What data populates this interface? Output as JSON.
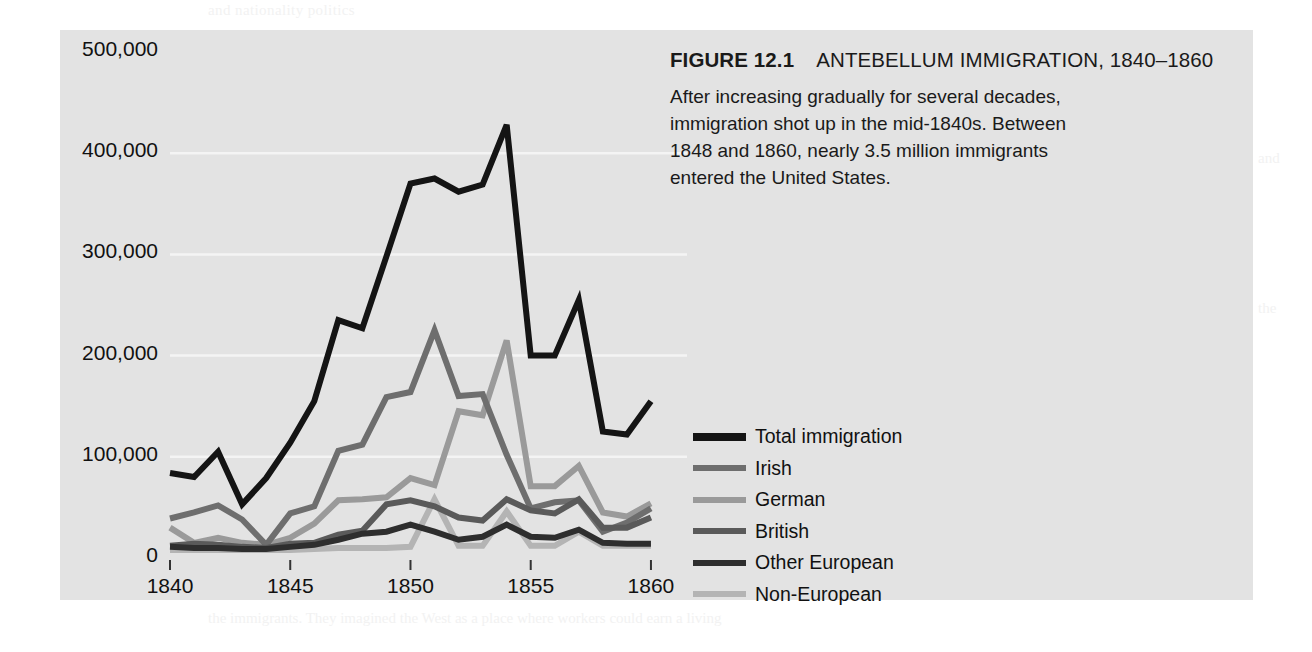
{
  "figure": {
    "number_label": "FIGURE 12.1",
    "title": "ANTEBELLUM IMMIGRATION, 1840–1860",
    "caption": "After increasing gradually for several decades, immigration shot up in the mid-1840s. Between 1848 and 1860, nearly 3.5 million immigrants entered the United States.",
    "panel_background": "#e3e3e3"
  },
  "chart_data": {
    "type": "line",
    "title": "ANTEBELLUM IMMIGRATION, 1840–1860",
    "xlabel": "",
    "ylabel": "",
    "xlim": [
      1840,
      1861
    ],
    "ylim": [
      0,
      500000
    ],
    "grid": true,
    "gridlines": [
      100000,
      200000,
      300000,
      400000
    ],
    "legend_position": "right",
    "x_tick_labels": [
      "1840",
      "1845",
      "1850",
      "1855",
      "1860"
    ],
    "x_ticks": [
      1840,
      1845,
      1850,
      1855,
      1860
    ],
    "y_tick_labels": [
      "0",
      "100,000",
      "200,000",
      "300,000",
      "400,000",
      "500,000"
    ],
    "y_ticks": [
      0,
      100000,
      200000,
      300000,
      400000,
      500000
    ],
    "x": [
      1840,
      1841,
      1842,
      1843,
      1844,
      1845,
      1846,
      1847,
      1848,
      1849,
      1850,
      1851,
      1852,
      1853,
      1854,
      1855,
      1856,
      1857,
      1858,
      1859,
      1860,
      1861
    ],
    "series": [
      {
        "name": "Total immigration",
        "color": "#141414",
        "width": 6,
        "values": [
          84000,
          80000,
          105000,
          53000,
          79000,
          114000,
          155000,
          235000,
          227000,
          298000,
          370000,
          375000,
          362000,
          369000,
          428000,
          200000,
          200000,
          255000,
          125000,
          122000,
          155000,
          0
        ]
      },
      {
        "name": "Irish",
        "color": "#6e6e6e",
        "width": 6,
        "values": [
          39000,
          45000,
          52000,
          38000,
          13000,
          44000,
          51000,
          106000,
          112000,
          159000,
          164000,
          225000,
          160000,
          162000,
          102000,
          49000,
          55000,
          57000,
          26000,
          35000,
          49000,
          0
        ]
      },
      {
        "name": "German",
        "color": "#9a9a9a",
        "width": 6,
        "values": [
          30000,
          15000,
          20000,
          15000,
          13000,
          20000,
          34000,
          57000,
          58000,
          60000,
          79000,
          72000,
          145000,
          141000,
          215000,
          71000,
          71000,
          91000,
          45000,
          41000,
          54000,
          0
        ]
      },
      {
        "name": "British",
        "color": "#5a5a5a",
        "width": 6,
        "values": [
          12000,
          14000,
          13000,
          11000,
          10000,
          14000,
          15000,
          23000,
          27000,
          53000,
          57000,
          51000,
          40000,
          37000,
          58000,
          47000,
          44000,
          58000,
          30000,
          30000,
          40000,
          0
        ]
      },
      {
        "name": "Other European",
        "color": "#2e2e2e",
        "width": 6,
        "values": [
          11000,
          10000,
          10000,
          9000,
          9000,
          11000,
          13000,
          18000,
          24000,
          26000,
          33000,
          26000,
          18000,
          21000,
          33000,
          21000,
          20000,
          28000,
          15000,
          14000,
          14000,
          0
        ]
      },
      {
        "name": "Non-European",
        "color": "#b4b4b4",
        "width": 6,
        "values": [
          8000,
          8000,
          8000,
          8000,
          8000,
          8000,
          9000,
          10000,
          10000,
          10000,
          11000,
          58000,
          12000,
          12000,
          46000,
          12000,
          12000,
          26000,
          12000,
          12000,
          12000,
          0
        ]
      }
    ]
  },
  "legend": {
    "items": [
      {
        "label": "Total immigration",
        "color": "#141414"
      },
      {
        "label": "Irish",
        "color": "#6e6e6e"
      },
      {
        "label": "German",
        "color": "#9a9a9a"
      },
      {
        "label": "British",
        "color": "#5a5a5a"
      },
      {
        "label": "Other European",
        "color": "#2e2e2e"
      },
      {
        "label": "Non-European",
        "color": "#b4b4b4"
      }
    ]
  },
  "page_ghost": {
    "top": "and nationality politics",
    "heading": "rd Movement",
    "l1": "to enter politics by forming a political",
    "l2": "party of the supporters of temperance",
    "l3": "reform. After debate and consideration, under",
    "l4": "the banner of temperance became a mass movement",
    "l5": "drive the political agenda of the 1850s, the Prohibition",
    "l6": "was driven by a mix of motives. However, the reform",
    "l7": "of the Know-Nothing movement and the temperance",
    "l8": "the late 1840s and early 1850s, a broad coalition of",
    "l9": "reformers took the lead in advancing the argument",
    "subheading": "Politics",
    "bottom": "the immigrants. They imagined the West as a place where workers could earn a living",
    "right1": "and",
    "right2": "the"
  }
}
